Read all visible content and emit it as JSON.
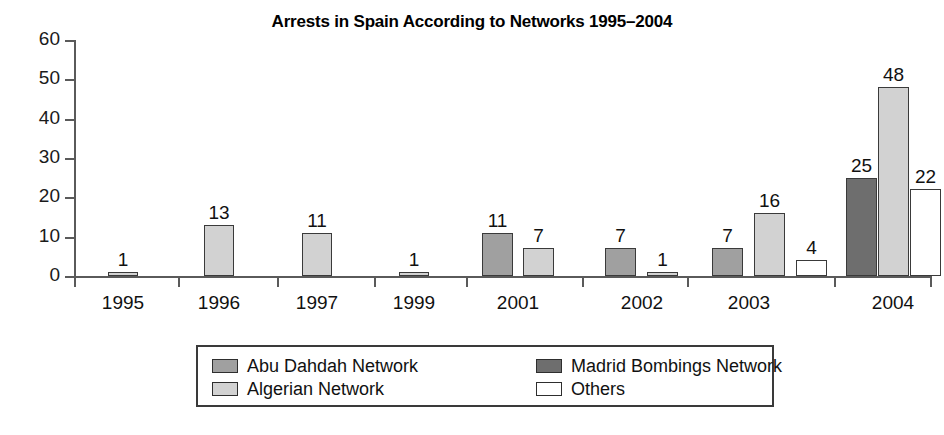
{
  "chart_data": {
    "type": "bar",
    "title": "Arrests in Spain According to Networks 1995–2004",
    "xlabel": "",
    "ylabel": "",
    "ylim": [
      0,
      60
    ],
    "yticks": [
      0,
      10,
      20,
      30,
      40,
      50,
      60
    ],
    "grid": false,
    "legend_position": "bottom",
    "categories": [
      "1995",
      "1996",
      "1997",
      "1999",
      "2001",
      "2002",
      "2003",
      "2004"
    ],
    "series": [
      {
        "name": "Abu Dahdah Network",
        "color": "#a0a0a0",
        "values": [
          null,
          null,
          null,
          null,
          11,
          7,
          7,
          null
        ]
      },
      {
        "name": "Algerian Network",
        "color": "#d2d2d2",
        "values": [
          1,
          13,
          11,
          1,
          7,
          1,
          16,
          48
        ]
      },
      {
        "name": "Madrid Bombings Network",
        "color": "#6e6e6e",
        "values": [
          null,
          null,
          null,
          null,
          null,
          null,
          null,
          25
        ]
      },
      {
        "name": "Others",
        "color": "#ffffff",
        "values": [
          null,
          null,
          null,
          null,
          null,
          null,
          4,
          22
        ]
      }
    ],
    "bars": [
      {
        "category": "1995",
        "series": "Algerian Network",
        "value": 1,
        "label": "1",
        "x": 34,
        "width": 30
      },
      {
        "category": "1996",
        "series": "Algerian Network",
        "value": 13,
        "label": "13",
        "x": 130,
        "width": 30
      },
      {
        "category": "1997",
        "series": "Algerian Network",
        "value": 11,
        "label": "11",
        "x": 228,
        "width": 30
      },
      {
        "category": "1999",
        "series": "Algerian Network",
        "value": 1,
        "label": "1",
        "x": 325,
        "width": 30
      },
      {
        "category": "2001",
        "series": "Abu Dahdah Network",
        "value": 11,
        "label": "11",
        "x": 408,
        "width": 31
      },
      {
        "category": "2001",
        "series": "Algerian Network",
        "value": 7,
        "label": "7",
        "x": 449,
        "width": 31
      },
      {
        "category": "2002",
        "series": "Abu Dahdah Network",
        "value": 7,
        "label": "7",
        "x": 531,
        "width": 31
      },
      {
        "category": "2002",
        "series": "Algerian Network",
        "value": 1,
        "label": "1",
        "x": 573,
        "width": 31
      },
      {
        "category": "2003",
        "series": "Abu Dahdah Network",
        "value": 7,
        "label": "7",
        "x": 638,
        "width": 31
      },
      {
        "category": "2003",
        "series": "Algerian Network",
        "value": 16,
        "label": "16",
        "x": 680,
        "width": 31
      },
      {
        "category": "2003",
        "series": "Others",
        "value": 4,
        "label": "4",
        "x": 722,
        "width": 31
      },
      {
        "category": "2004",
        "series": "Madrid Bombings Network",
        "value": 25,
        "label": "25",
        "x": 772,
        "width": 31
      },
      {
        "category": "2004",
        "series": "Algerian Network",
        "value": 48,
        "label": "48",
        "x": 804,
        "width": 31
      },
      {
        "category": "2004",
        "series": "Others",
        "value": 22,
        "label": "22",
        "x": 836,
        "width": 31
      }
    ],
    "category_centers": [
      49,
      145,
      243,
      340,
      444,
      568,
      675,
      819
    ],
    "x_tick_positions": [
      0,
      104,
      203,
      300,
      392,
      508,
      613,
      760,
      856
    ]
  },
  "legend": {
    "entries": [
      {
        "label": "Abu Dahdah Network",
        "swatch": "#a0a0a0"
      },
      {
        "label": "Madrid Bombings Network",
        "swatch": "#6e6e6e"
      },
      {
        "label": "Algerian Network",
        "swatch": "#d2d2d2"
      },
      {
        "label": "Others",
        "swatch": "#ffffff"
      }
    ]
  }
}
